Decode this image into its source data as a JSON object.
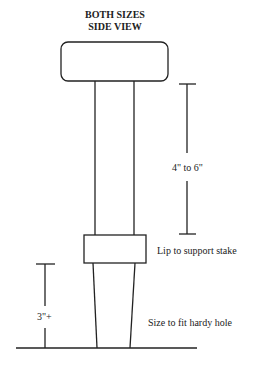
{
  "title": {
    "line1": "BOTH SIZES",
    "line2": "SIDE VIEW"
  },
  "labels": {
    "shaft_length": "4\" to 6\"",
    "lip": "Lip to support stake",
    "shank_length": "3\"+",
    "shank_fit": "Size to fit hardy hole"
  },
  "colors": {
    "stroke": "#222222",
    "background": "#ffffff"
  }
}
